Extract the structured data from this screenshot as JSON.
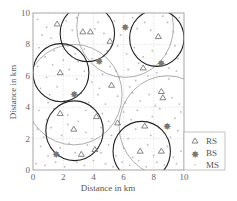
{
  "chart_data": {
    "type": "scatter",
    "title": "",
    "xlabel": "Distance in km",
    "ylabel": "Distance in km",
    "xlim": [
      0,
      10
    ],
    "ylim": [
      0,
      10
    ],
    "xticks": [
      "0",
      "2",
      "4",
      "6",
      "8",
      "10"
    ],
    "yticks": [
      "0",
      "2",
      "4",
      "6",
      "8",
      "10"
    ],
    "grid": true,
    "legend_position": "lower right outside",
    "legend": [
      {
        "label": "RS",
        "marker": "triangle"
      },
      {
        "label": "BS",
        "marker": "star"
      },
      {
        "label": "MS",
        "marker": "dot"
      }
    ],
    "series": [
      {
        "name": "RS",
        "marker": "triangle",
        "points": [
          [
            1.6,
            9.3
          ],
          [
            3.3,
            8.8
          ],
          [
            3.8,
            8.8
          ],
          [
            5.1,
            8.2
          ],
          [
            8.3,
            8.5
          ],
          [
            1.8,
            6.2
          ],
          [
            7.3,
            6.5
          ],
          [
            5.2,
            5.4
          ],
          [
            8.5,
            5.0
          ],
          [
            8.6,
            4.6
          ],
          [
            1.8,
            3.6
          ],
          [
            4.2,
            3.4
          ],
          [
            2.7,
            2.6
          ],
          [
            5.6,
            3.0
          ],
          [
            7.4,
            2.8
          ],
          [
            7.1,
            1.2
          ],
          [
            8.5,
            1.2
          ],
          [
            3.2,
            1.0
          ],
          [
            4.1,
            1.3
          ]
        ]
      },
      {
        "name": "BS",
        "marker": "star",
        "points": [
          [
            6.1,
            9.1
          ],
          [
            4.4,
            6.9
          ],
          [
            8.5,
            6.8
          ],
          [
            2.7,
            4.8
          ],
          [
            8.9,
            2.8
          ],
          [
            1.5,
            1.0
          ]
        ]
      },
      {
        "name": "MS",
        "marker": "dot",
        "points": [
          [
            0.3,
            9.6
          ],
          [
            0.9,
            9.1
          ],
          [
            1.2,
            8.4
          ],
          [
            2.2,
            9.5
          ],
          [
            2.6,
            8.9
          ],
          [
            2.9,
            9.7
          ],
          [
            4.3,
            9.4
          ],
          [
            4.7,
            8.7
          ],
          [
            5.4,
            9.5
          ],
          [
            5.8,
            8.6
          ],
          [
            6.6,
            9.7
          ],
          [
            6.9,
            9.0
          ],
          [
            7.4,
            9.4
          ],
          [
            7.8,
            8.9
          ],
          [
            8.9,
            9.4
          ],
          [
            9.3,
            8.8
          ],
          [
            9.7,
            9.7
          ],
          [
            0.4,
            7.8
          ],
          [
            0.8,
            7.2
          ],
          [
            1.4,
            7.6
          ],
          [
            2.3,
            7.9
          ],
          [
            2.8,
            7.4
          ],
          [
            3.4,
            7.7
          ],
          [
            3.9,
            7.1
          ],
          [
            4.9,
            7.6
          ],
          [
            5.6,
            7.9
          ],
          [
            6.2,
            7.4
          ],
          [
            6.7,
            7.8
          ],
          [
            7.3,
            7.2
          ],
          [
            7.9,
            7.6
          ],
          [
            8.8,
            7.4
          ],
          [
            9.4,
            7.9
          ],
          [
            9.6,
            7.1
          ],
          [
            0.3,
            6.6
          ],
          [
            0.9,
            5.9
          ],
          [
            1.3,
            6.7
          ],
          [
            2.4,
            6.4
          ],
          [
            2.9,
            5.8
          ],
          [
            3.4,
            6.3
          ],
          [
            3.9,
            5.6
          ],
          [
            4.6,
            6.1
          ],
          [
            5.1,
            6.6
          ],
          [
            5.7,
            5.9
          ],
          [
            6.3,
            6.4
          ],
          [
            6.8,
            5.7
          ],
          [
            7.6,
            6.0
          ],
          [
            8.2,
            6.2
          ],
          [
            9.0,
            5.8
          ],
          [
            9.5,
            6.3
          ],
          [
            0.5,
            5.2
          ],
          [
            1.1,
            4.8
          ],
          [
            1.6,
            5.3
          ],
          [
            2.1,
            4.4
          ],
          [
            3.2,
            4.9
          ],
          [
            3.7,
            4.3
          ],
          [
            4.3,
            4.8
          ],
          [
            4.8,
            4.2
          ],
          [
            5.6,
            4.7
          ],
          [
            6.1,
            4.3
          ],
          [
            6.6,
            4.9
          ],
          [
            7.1,
            4.4
          ],
          [
            7.7,
            4.8
          ],
          [
            8.1,
            4.1
          ],
          [
            9.2,
            4.6
          ],
          [
            9.7,
            4.2
          ],
          [
            0.4,
            3.8
          ],
          [
            0.9,
            3.2
          ],
          [
            1.4,
            3.9
          ],
          [
            2.3,
            3.5
          ],
          [
            3.0,
            3.1
          ],
          [
            3.5,
            3.8
          ],
          [
            4.6,
            3.6
          ],
          [
            5.0,
            3.1
          ],
          [
            6.0,
            3.7
          ],
          [
            6.5,
            3.2
          ],
          [
            6.9,
            3.8
          ],
          [
            7.9,
            3.4
          ],
          [
            8.4,
            3.9
          ],
          [
            9.4,
            3.3
          ],
          [
            9.8,
            3.7
          ],
          [
            0.3,
            2.6
          ],
          [
            0.7,
            2.1
          ],
          [
            1.2,
            2.7
          ],
          [
            1.9,
            2.2
          ],
          [
            2.3,
            2.9
          ],
          [
            3.5,
            2.4
          ],
          [
            3.9,
            2.0
          ],
          [
            4.5,
            2.7
          ],
          [
            5.2,
            2.2
          ],
          [
            5.8,
            2.5
          ],
          [
            6.3,
            2.0
          ],
          [
            6.8,
            2.6
          ],
          [
            7.8,
            2.2
          ],
          [
            8.3,
            2.7
          ],
          [
            9.1,
            2.1
          ],
          [
            9.6,
            2.5
          ],
          [
            0.5,
            1.5
          ],
          [
            1.0,
            0.9
          ],
          [
            1.8,
            1.4
          ],
          [
            2.4,
            1.7
          ],
          [
            2.8,
            1.1
          ],
          [
            3.6,
            1.6
          ],
          [
            4.5,
            1.1
          ],
          [
            5.0,
            1.6
          ],
          [
            5.5,
            0.9
          ],
          [
            6.0,
            1.4
          ],
          [
            6.6,
            0.8
          ],
          [
            7.6,
            1.6
          ],
          [
            8.0,
            0.9
          ],
          [
            8.9,
            1.5
          ],
          [
            9.3,
            0.8
          ],
          [
            9.8,
            1.2
          ],
          [
            0.2,
            0.4
          ],
          [
            0.8,
            0.3
          ],
          [
            1.5,
            0.5
          ],
          [
            2.1,
            0.2
          ],
          [
            2.9,
            0.5
          ],
          [
            3.4,
            0.3
          ],
          [
            4.0,
            0.6
          ],
          [
            4.8,
            0.4
          ],
          [
            5.3,
            0.2
          ],
          [
            5.9,
            0.5
          ],
          [
            6.4,
            0.3
          ],
          [
            7.0,
            0.6
          ],
          [
            7.5,
            0.2
          ],
          [
            8.2,
            0.5
          ],
          [
            8.7,
            0.3
          ],
          [
            9.5,
            0.4
          ],
          [
            1.0,
            4.3
          ],
          [
            4.1,
            9.0
          ],
          [
            5.5,
            6.3
          ],
          [
            7.0,
            6.8
          ],
          [
            3.0,
            6.9
          ],
          [
            0.6,
            8.6
          ],
          [
            8.6,
            9.8
          ],
          [
            6.4,
            5.3
          ],
          [
            2.0,
            7.0
          ],
          [
            9.0,
            6.5
          ],
          [
            4.4,
            5.2
          ],
          [
            7.2,
            9.9
          ]
        ]
      }
    ],
    "coverage_circles": [
      {
        "type": "BS coverage",
        "color": "#999999",
        "cx": 6.1,
        "cy": 9.1,
        "r": 3.2
      },
      {
        "type": "BS coverage",
        "color": "#999999",
        "cx": 2.7,
        "cy": 4.8,
        "r": 3.2
      },
      {
        "type": "BS coverage",
        "color": "#999999",
        "cx": 8.9,
        "cy": 2.8,
        "r": 3.2
      },
      {
        "type": "RS coverage",
        "color": "#222222",
        "cx": 3.6,
        "cy": 8.7,
        "r": 1.8
      },
      {
        "type": "RS coverage",
        "color": "#222222",
        "cx": 8.2,
        "cy": 8.4,
        "r": 1.8
      },
      {
        "type": "RS coverage",
        "color": "#222222",
        "cx": 1.85,
        "cy": 6.2,
        "r": 1.85
      },
      {
        "type": "RS coverage",
        "color": "#222222",
        "cx": 2.75,
        "cy": 2.5,
        "r": 1.9
      },
      {
        "type": "RS coverage",
        "color": "#222222",
        "cx": 7.2,
        "cy": 1.2,
        "r": 1.9
      }
    ],
    "colors": {
      "rs": "#777777",
      "bs": "#777777",
      "ms": "#bbbbbb",
      "grid": "#cccccc",
      "axis": "#999999"
    }
  }
}
